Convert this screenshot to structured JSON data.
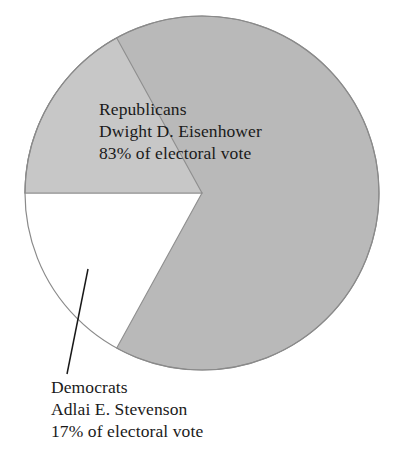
{
  "chart_data": {
    "type": "pie",
    "title": "",
    "categories": [
      "Republicans",
      "Democrats"
    ],
    "values": [
      83,
      17
    ],
    "unit": "% of electoral vote",
    "legend_position": "on-slice",
    "grid": false,
    "slices": [
      {
        "party": "Republicans",
        "candidate": "Dwight D. Eisenhower",
        "value": 83,
        "value_text": "83% of electoral vote",
        "color": "#b9b9b9",
        "start_angle_deg": 180,
        "end_angle_deg": 479,
        "sweep_deg": 298.8,
        "label_placement": "inside"
      },
      {
        "party": "Democrats",
        "candidate": "Adlai E. Stevenson",
        "value": 17,
        "value_text": "17% of electoral vote",
        "color": "#c7c7c7",
        "start_angle_deg": 180,
        "end_angle_deg": 241.2,
        "sweep_deg": 61.2,
        "label_placement": "outside-leader-line"
      }
    ]
  },
  "labels": {
    "republican": {
      "party": "Republicans",
      "candidate": "Dwight D. Eisenhower",
      "share": "83% of electoral vote"
    },
    "democrat": {
      "party": "Democrats",
      "candidate": "Adlai E. Stevenson",
      "share": "17% of electoral vote"
    }
  },
  "colors": {
    "republican_slice": "#b9b9b9",
    "democrat_slice": "#c7c7c7",
    "outline": "#8a8a8a",
    "leader_line": "#1a1a1a",
    "text": "#1a1a1a",
    "background": "#ffffff"
  },
  "geometry": {
    "center_x": 202,
    "center_y": 193,
    "radius": 177
  }
}
